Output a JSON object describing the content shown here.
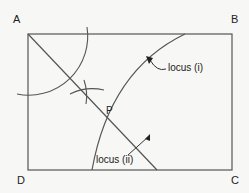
{
  "diagram": {
    "vertices": {
      "A": "A",
      "B": "B",
      "C": "C",
      "D": "D"
    },
    "point_label": "P",
    "locus_1_label": "locus (i)",
    "locus_2_label": "locus (ii)",
    "line_color": "#555555",
    "background": "#f7f7f5"
  }
}
